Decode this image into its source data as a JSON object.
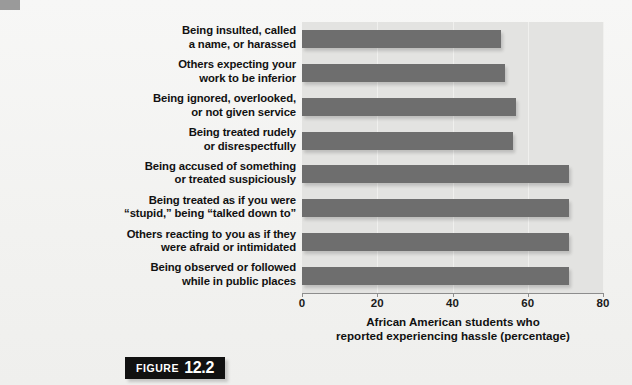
{
  "figure": {
    "word": "FIGURE",
    "number": "12.2"
  },
  "chart_data": {
    "type": "bar",
    "orientation": "horizontal",
    "title": "",
    "xlabel_lines": [
      "African American students who",
      "reported experiencing hassle (percentage)"
    ],
    "xlabel": "African American students who reported experiencing hassle (percentage)",
    "ylabel": "",
    "xlim": [
      0,
      80
    ],
    "xticks": [
      0,
      20,
      40,
      60,
      80
    ],
    "xtick_labels": [
      "0",
      "20",
      "40",
      "60",
      "80"
    ],
    "grid": true,
    "grid_axis": "x",
    "legend": false,
    "bar_color": "#6e6e6e",
    "plot_background": "#e3e3e1",
    "categories": [
      "Being insulted, called\na name, or harassed",
      "Others expecting your\nwork to be inferior",
      "Being ignored, overlooked,\nor not given service",
      "Being treated rudely\nor disrespectfully",
      "Being accused of something\nor treated suspiciously",
      "Being treated as if you were\n“stupid,” being “talked down to”",
      "Others reacting to you as if they\nwere afraid or intimidated",
      "Being observed or followed\nwhile in public places"
    ],
    "category_lines": [
      [
        "Being insulted, called",
        "a name, or harassed"
      ],
      [
        "Others expecting your",
        "work to be inferior"
      ],
      [
        "Being ignored, overlooked,",
        "or not given service"
      ],
      [
        "Being treated rudely",
        "or disrespectfully"
      ],
      [
        "Being accused of something",
        "or treated suspiciously"
      ],
      [
        "Being treated as if you were",
        "“stupid,” being “talked down to”"
      ],
      [
        "Others reacting to you as if they",
        "were afraid or intimidated"
      ],
      [
        "Being observed or followed",
        "while in public places"
      ]
    ],
    "values": [
      53,
      54,
      57,
      56,
      71,
      71,
      71,
      71
    ]
  }
}
